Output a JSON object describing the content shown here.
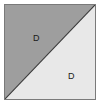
{
  "figure": {
    "shape": "square",
    "divider": "diagonal from bottom-left corner to top-right corner",
    "border_color": "#7a7a7a",
    "background_color": "#ffffff",
    "divider_color": "#3a3a3a",
    "regions": [
      {
        "id": "upper-left",
        "label": "D",
        "fill": "#9e9e9e",
        "position": "upper-left triangle"
      },
      {
        "id": "lower-right",
        "label": "D",
        "fill": "#e8e8e8",
        "position": "lower-right triangle"
      }
    ]
  }
}
